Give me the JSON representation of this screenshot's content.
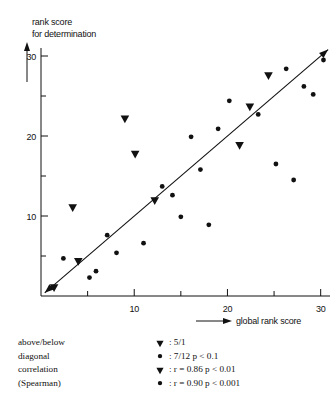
{
  "chart_data": {
    "type": "scatter",
    "title": "",
    "xlabel": "global rank score",
    "ylabel": "rank score for determination",
    "xlim": [
      0,
      31
    ],
    "ylim": [
      0,
      31
    ],
    "grid": false,
    "x_ticks_major": [
      10,
      20,
      30
    ],
    "x_ticks_minor": [
      5,
      15,
      25
    ],
    "y_ticks_major": [
      10,
      20,
      30
    ],
    "y_ticks_minor": [
      5,
      15,
      25
    ],
    "x_tick_labels": [
      "10",
      "20",
      "30"
    ],
    "y_tick_labels": [
      "10",
      "20",
      "30"
    ],
    "reference_line": {
      "name": "diagonal",
      "x0": 0.4,
      "y0": 0.4,
      "x1": 30.8,
      "y1": 30.8,
      "arrow_start": true,
      "arrow_end": true
    },
    "series": [
      {
        "name": "triangle-markers",
        "marker": "triangle-down",
        "points": [
          [
            1.4,
            1.0
          ],
          [
            4.0,
            4.3
          ],
          [
            3.4,
            11.0
          ],
          [
            9.0,
            22.1
          ],
          [
            10.1,
            17.7
          ],
          [
            12.2,
            11.9
          ],
          [
            21.3,
            18.8
          ],
          [
            22.4,
            23.6
          ],
          [
            24.4,
            27.5
          ]
        ]
      },
      {
        "name": "circle-markers",
        "marker": "circle",
        "points": [
          [
            2.4,
            4.7
          ],
          [
            5.2,
            2.3
          ],
          [
            5.9,
            3.1
          ],
          [
            7.1,
            7.6
          ],
          [
            8.1,
            5.4
          ],
          [
            11.0,
            6.6
          ],
          [
            13.0,
            13.7
          ],
          [
            14.1,
            12.6
          ],
          [
            15.0,
            9.9
          ],
          [
            16.1,
            19.9
          ],
          [
            17.1,
            15.8
          ],
          [
            18.0,
            8.9
          ],
          [
            19.0,
            20.9
          ],
          [
            20.2,
            24.4
          ],
          [
            23.3,
            22.7
          ],
          [
            25.2,
            16.5
          ],
          [
            26.3,
            28.4
          ],
          [
            27.1,
            14.5
          ],
          [
            28.2,
            26.2
          ],
          [
            29.2,
            25.2
          ],
          [
            30.3,
            29.5
          ]
        ]
      }
    ]
  },
  "axis": {
    "y_label_line1": "rank score",
    "y_label_line2": "for determination",
    "x_label": "global rank score"
  },
  "legend": {
    "left_lines": [
      "above/below",
      "diagonal",
      "correlation",
      "(Spearman)"
    ],
    "right_entries": [
      {
        "symbol": "triangle",
        "text": ": 5/1"
      },
      {
        "symbol": "circle",
        "text": ": 7/12 p < 0.1"
      },
      {
        "symbol": "triangle",
        "text": ": r = 0.86 p < 0.01"
      },
      {
        "symbol": "circle",
        "text": ": r = 0.90 p < 0.001"
      }
    ]
  },
  "colors": {
    "ink": "#111111",
    "background": "#ffffff"
  }
}
